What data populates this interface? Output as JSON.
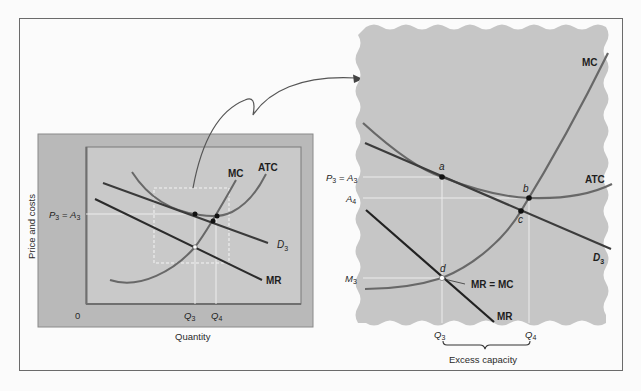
{
  "figure": {
    "left_panel": {
      "y_axis_label": "Price and costs",
      "x_axis_label": "Quantity",
      "origin_label": "0",
      "curve_labels": {
        "mc": "MC",
        "atc": "ATC",
        "demand": "D",
        "demand_sub": "3",
        "mr": "MR"
      },
      "price_label": {
        "p": "P",
        "p_sub": "3",
        "eq": " = ",
        "a": "A",
        "a_sub": "3"
      },
      "q_labels": {
        "q3": "Q",
        "q3_sub": "3",
        "q4": "Q",
        "q4_sub": "4"
      }
    },
    "right_panel": {
      "curve_labels": {
        "mc": "MC",
        "atc": "ATC",
        "demand": "D",
        "demand_sub": "3",
        "mr": "MR",
        "mr_eq_mc": "MR = MC"
      },
      "point_labels": {
        "a": "a",
        "b": "b",
        "c": "c",
        "d": "d"
      },
      "y_labels": {
        "p3a3": {
          "p": "P",
          "p_sub": "3",
          "eq": " = ",
          "a": "A",
          "a_sub": "3"
        },
        "a4": {
          "a": "A",
          "a_sub": "4"
        },
        "m3": {
          "m": "M",
          "m_sub": "3"
        }
      },
      "q_labels": {
        "q3": "Q",
        "q3_sub": "3",
        "q4": "Q",
        "q4_sub": "4"
      },
      "brace_label": "Excess capacity"
    },
    "colors": {
      "background": "#fbfbfb",
      "frame": "#6b6b6b",
      "panel_outer": "#b9b9b9",
      "panel_inner": "#c9c9c9",
      "zoom_panel": "#c6c6c6",
      "curve_gray": "#686868",
      "curve_dark": "#2b2b2b",
      "guide_line": "#ececec"
    }
  }
}
